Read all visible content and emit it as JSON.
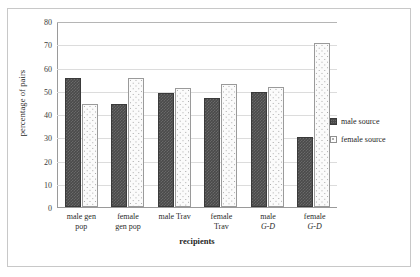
{
  "chart_data": {
    "type": "bar",
    "title": "",
    "xlabel": "recipients",
    "ylabel": "percentage of pairs",
    "ylim": [
      0,
      80
    ],
    "ytick_values": [
      80,
      70,
      60,
      50,
      40,
      30,
      20,
      10,
      0
    ],
    "ytick_labels": [
      "80",
      "70",
      "60",
      "50",
      "40",
      "30",
      "20",
      "10",
      "0"
    ],
    "grid": true,
    "legend_position": "right",
    "categories": [
      "male gen pop",
      "female gen pop",
      "male Trav",
      "female Trav",
      "male G-D",
      "female G-D"
    ],
    "category_lines": [
      [
        "male gen",
        "pop"
      ],
      [
        "female",
        "gen pop"
      ],
      [
        "male Trav",
        ""
      ],
      [
        "female",
        "Trav"
      ],
      [
        "male ",
        "G-D"
      ],
      [
        "female",
        "G-D"
      ]
    ],
    "series": [
      {
        "name": "male source",
        "color": "#4a4a4a",
        "pattern": "crosshatch",
        "values": [
          55.5,
          44.5,
          49.0,
          47.0,
          49.5,
          30.0
        ]
      },
      {
        "name": "female source",
        "color": "#fbfbfb",
        "pattern": "dotted",
        "values": [
          44.5,
          55.5,
          51.0,
          53.0,
          51.5,
          70.5
        ]
      }
    ]
  },
  "legend": {
    "items": [
      {
        "label": "male source",
        "swatch": "male-source-swatch"
      },
      {
        "label": "female source",
        "swatch": "female-source-swatch"
      }
    ]
  }
}
